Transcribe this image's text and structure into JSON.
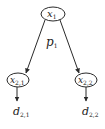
{
  "diagram": {
    "type": "tree",
    "colors": {
      "stroke": "#2a2a2a",
      "text": "#222222",
      "background": "#ffffff"
    },
    "nodes": {
      "root": {
        "base": "x",
        "sub": "1"
      },
      "left": {
        "base": "x",
        "sub": "2,1"
      },
      "right": {
        "base": "x",
        "sub": "2,2"
      }
    },
    "edge_label": {
      "base": "p",
      "sub": "1"
    },
    "outputs": {
      "left": {
        "base": "d",
        "sub": "2,1"
      },
      "right": {
        "base": "d",
        "sub": "2,2"
      }
    }
  }
}
